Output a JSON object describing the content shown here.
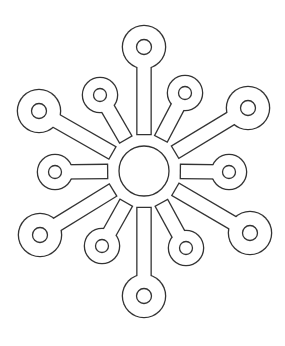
{
  "title": "Snowflake coloring page",
  "colors": {
    "background": "#ffffff",
    "line": "#333333",
    "fill": "#ffffff"
  },
  "snowflake": {
    "center": {
      "x": 144,
      "y": 171,
      "radius": 25,
      "gap_radius": 37
    },
    "arm_width": 13,
    "arms": [
      {
        "name": "top",
        "x": 144,
        "y": 47,
        "outer_r": 21,
        "inner_r": 7.5
      },
      {
        "name": "upper-right-small",
        "x": 185,
        "y": 93,
        "outer_r": 17,
        "inner_r": 6.5
      },
      {
        "name": "upper-right-big",
        "x": 248,
        "y": 108,
        "outer_r": 21,
        "inner_r": 7.5
      },
      {
        "name": "right",
        "x": 229,
        "y": 172,
        "outer_r": 17,
        "inner_r": 6.5
      },
      {
        "name": "lower-right-big",
        "x": 250,
        "y": 233,
        "outer_r": 21,
        "inner_r": 7.5
      },
      {
        "name": "lower-right-small",
        "x": 186,
        "y": 248,
        "outer_r": 17,
        "inner_r": 6.5
      },
      {
        "name": "bottom",
        "x": 144,
        "y": 296,
        "outer_r": 21,
        "inner_r": 7.5
      },
      {
        "name": "lower-left-small",
        "x": 102,
        "y": 246,
        "outer_r": 17,
        "inner_r": 6.5
      },
      {
        "name": "lower-left-big",
        "x": 40,
        "y": 235,
        "outer_r": 21,
        "inner_r": 7.5
      },
      {
        "name": "left",
        "x": 55,
        "y": 172,
        "outer_r": 17,
        "inner_r": 6.5
      },
      {
        "name": "upper-left-big",
        "x": 39,
        "y": 111,
        "outer_r": 21,
        "inner_r": 7.5
      },
      {
        "name": "upper-left-small",
        "x": 100,
        "y": 95,
        "outer_r": 17,
        "inner_r": 6.5
      }
    ]
  }
}
